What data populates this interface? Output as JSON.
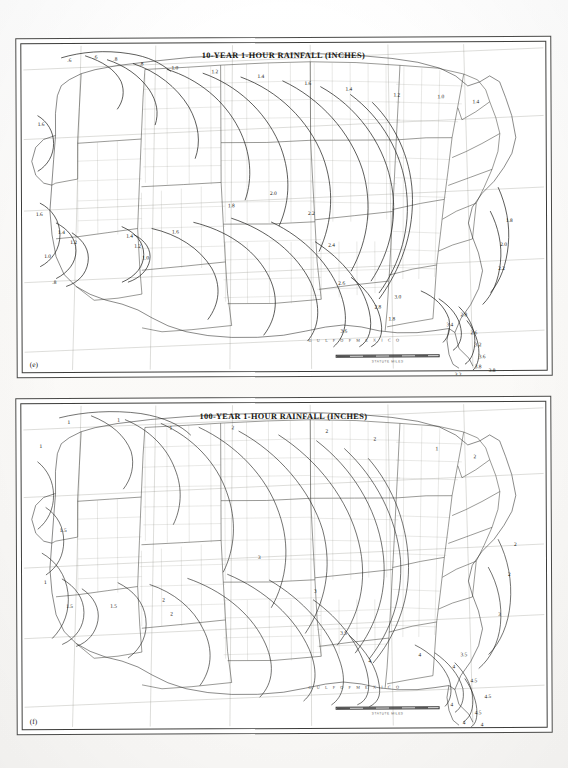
{
  "document": {
    "type": "scanned-atlas-page",
    "background_color": "#fcfcfb",
    "panel_count": 2
  },
  "figures": [
    {
      "id": "figure-e",
      "panel_label": "(e)",
      "title": "10-YEAR 1-HOUR RAINFALL (INCHES)",
      "ocean_label": "G U L F   O F   M E X I C O",
      "scale_caption": "STATUTE MILES",
      "contour_labels": [
        {
          "value": ".6",
          "x": 46,
          "y": 14
        },
        {
          "value": ".6",
          "x": 72,
          "y": 11
        },
        {
          "value": ".8",
          "x": 92,
          "y": 13
        },
        {
          "value": ".8",
          "x": 118,
          "y": 18
        },
        {
          "value": "1.0",
          "x": 150,
          "y": 22
        },
        {
          "value": "1.2",
          "x": 190,
          "y": 26
        },
        {
          "value": "1.4",
          "x": 236,
          "y": 31
        },
        {
          "value": "1.6",
          "x": 283,
          "y": 38
        },
        {
          "value": "1.4",
          "x": 324,
          "y": 44
        },
        {
          "value": "1.2",
          "x": 372,
          "y": 50
        },
        {
          "value": "1.0",
          "x": 416,
          "y": 52
        },
        {
          "value": "1.4",
          "x": 451,
          "y": 57
        },
        {
          "value": "1.6",
          "x": 16,
          "y": 78
        },
        {
          "value": "1.6",
          "x": 14,
          "y": 168
        },
        {
          "value": "1.4",
          "x": 36,
          "y": 186
        },
        {
          "value": "1.2",
          "x": 48,
          "y": 196
        },
        {
          "value": "1.0",
          "x": 22,
          "y": 210
        },
        {
          "value": ".8",
          "x": 30,
          "y": 236
        },
        {
          "value": "1.4",
          "x": 104,
          "y": 190
        },
        {
          "value": "1.2",
          "x": 112,
          "y": 200
        },
        {
          "value": "1.0",
          "x": 120,
          "y": 212
        },
        {
          "value": "1.6",
          "x": 150,
          "y": 186
        },
        {
          "value": "1.8",
          "x": 206,
          "y": 160
        },
        {
          "value": "2.0",
          "x": 248,
          "y": 148
        },
        {
          "value": "2.2",
          "x": 286,
          "y": 168
        },
        {
          "value": "2.4",
          "x": 306,
          "y": 200
        },
        {
          "value": "2.6",
          "x": 316,
          "y": 238
        },
        {
          "value": "2.8",
          "x": 352,
          "y": 262
        },
        {
          "value": "3.0",
          "x": 372,
          "y": 252
        },
        {
          "value": "1.8",
          "x": 366,
          "y": 274
        },
        {
          "value": "3.6",
          "x": 318,
          "y": 286
        },
        {
          "value": "3.4",
          "x": 424,
          "y": 280
        },
        {
          "value": "2.8",
          "x": 438,
          "y": 270
        },
        {
          "value": "2.6",
          "x": 448,
          "y": 288
        },
        {
          "value": "3.2",
          "x": 452,
          "y": 300
        },
        {
          "value": "3.6",
          "x": 456,
          "y": 312
        },
        {
          "value": "3.8",
          "x": 452,
          "y": 322
        },
        {
          "value": "3.8",
          "x": 466,
          "y": 326
        },
        {
          "value": "3.2",
          "x": 432,
          "y": 330
        },
        {
          "value": "2.2",
          "x": 476,
          "y": 224
        },
        {
          "value": "2.0",
          "x": 478,
          "y": 200
        },
        {
          "value": "1.8",
          "x": 484,
          "y": 176
        }
      ]
    },
    {
      "id": "figure-f",
      "panel_label": "(f)",
      "title": "100-YEAR 1-HOUR RAINFALL (INCHES)",
      "ocean_label": "G U L F   O F   M E X I C O",
      "scale_caption": "STATUTE MILES",
      "contour_labels": [
        {
          "value": "1",
          "x": 46,
          "y": 16
        },
        {
          "value": "1",
          "x": 96,
          "y": 14
        },
        {
          "value": "1",
          "x": 148,
          "y": 22
        },
        {
          "value": "2",
          "x": 210,
          "y": 22
        },
        {
          "value": "2",
          "x": 304,
          "y": 26
        },
        {
          "value": "2",
          "x": 352,
          "y": 34
        },
        {
          "value": "1",
          "x": 414,
          "y": 44
        },
        {
          "value": "2",
          "x": 452,
          "y": 52
        },
        {
          "value": "1",
          "x": 18,
          "y": 40
        },
        {
          "value": "1.5",
          "x": 38,
          "y": 124
        },
        {
          "value": "1.5",
          "x": 44,
          "y": 200
        },
        {
          "value": "1",
          "x": 22,
          "y": 176
        },
        {
          "value": "1.5",
          "x": 88,
          "y": 200
        },
        {
          "value": "2",
          "x": 140,
          "y": 194
        },
        {
          "value": "2",
          "x": 148,
          "y": 208
        },
        {
          "value": "3",
          "x": 236,
          "y": 152
        },
        {
          "value": "3",
          "x": 292,
          "y": 186
        },
        {
          "value": "3.5",
          "x": 318,
          "y": 228
        },
        {
          "value": "4",
          "x": 346,
          "y": 256
        },
        {
          "value": "4",
          "x": 396,
          "y": 250
        },
        {
          "value": "4",
          "x": 430,
          "y": 262
        },
        {
          "value": "3.5",
          "x": 438,
          "y": 250
        },
        {
          "value": "4.5",
          "x": 448,
          "y": 276
        },
        {
          "value": "4.5",
          "x": 462,
          "y": 292
        },
        {
          "value": "4",
          "x": 428,
          "y": 300
        },
        {
          "value": "4.5",
          "x": 452,
          "y": 308
        },
        {
          "value": "4",
          "x": 440,
          "y": 318
        },
        {
          "value": "4",
          "x": 458,
          "y": 320
        },
        {
          "value": "3",
          "x": 476,
          "y": 210
        },
        {
          "value": "2",
          "x": 486,
          "y": 170
        },
        {
          "value": "2",
          "x": 492,
          "y": 140
        }
      ]
    }
  ]
}
